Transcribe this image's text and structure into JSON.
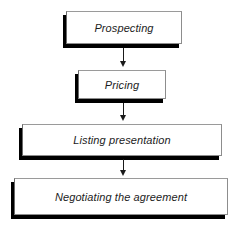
{
  "diagram": {
    "type": "vertical-flowchart",
    "background_color": "#ffffff",
    "box_fill_color": "#ffffff",
    "box_border_color": "#8d8d8d",
    "shadow_color": "#000000",
    "text_color": "#1c1c1c",
    "arrow_color": "#1a1a1a",
    "nodes": [
      {
        "id": "prospecting",
        "label": "Prospecting"
      },
      {
        "id": "pricing",
        "label": "Pricing"
      },
      {
        "id": "listing",
        "label": "Listing presentation"
      },
      {
        "id": "negotiating",
        "label": "Negotiating the agreement"
      }
    ],
    "connectors": [
      {
        "id": "arrow-1",
        "from": "prospecting",
        "to": "pricing",
        "glyph": "down-arrow"
      },
      {
        "id": "arrow-2",
        "from": "pricing",
        "to": "listing",
        "glyph": "down-arrow"
      },
      {
        "id": "arrow-3",
        "from": "listing",
        "to": "negotiating",
        "glyph": "down-arrow"
      }
    ]
  }
}
